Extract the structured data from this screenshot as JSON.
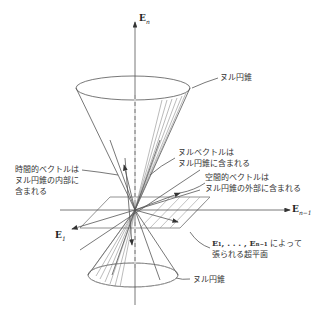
{
  "axes": {
    "vertical": {
      "label": "E",
      "subscript": "n"
    },
    "horizontal": {
      "label": "E",
      "subscript": "n−1"
    },
    "diagonal": {
      "label": "E",
      "subscript": "1"
    }
  },
  "labels": {
    "null_cone_top": "ヌル円錐",
    "null_cone_bottom": "ヌル円錐",
    "null_vector_line1": "ヌルベクトルは",
    "null_vector_line2": "ヌル円錐に含まれる",
    "spacelike_line1": "空間的ベクトルは",
    "spacelike_line2": "ヌル円錐の外部に含まれる",
    "timelike_line1": "時間的ベクトルは",
    "timelike_line2": "ヌル円錐の内部に",
    "timelike_line3": "含まれる",
    "hyperplane_line1_math": "E₁, . . . , Eₙ₋₁",
    "hyperplane_line1_text": " によって",
    "hyperplane_line2": "張られる超平面"
  },
  "colors": {
    "line": "#555555",
    "text": "#333333",
    "background": "#ffffff"
  }
}
